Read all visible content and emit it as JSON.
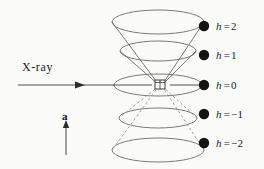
{
  "figure": {
    "background_color": "#fbfbfa",
    "line_color": "#5a5a5a",
    "beam_color": "#3c3c3c",
    "dot_color": "#141414"
  },
  "beam": {
    "label": "X-ray",
    "arrow_name": "incident-beam-arrow"
  },
  "axis": {
    "label": "a",
    "arrow_name": "rotation-axis-arrow"
  },
  "crystal": {
    "name": "crystal-sample",
    "shape": "cube"
  },
  "cones": [
    {
      "symbol": "h",
      "relation": "=",
      "value": "2",
      "label": "h = 2",
      "layer": 2,
      "dot_x": 204,
      "dot_y": 26,
      "label_x": 216,
      "label_y": 20,
      "ellipse_cy": 22,
      "ellipse_rx": 46,
      "ellipse_ry": 12,
      "hidden": false
    },
    {
      "symbol": "h",
      "relation": "=",
      "value": "1",
      "label": "h = 1",
      "layer": 1,
      "dot_x": 204,
      "dot_y": 55,
      "label_x": 216,
      "label_y": 49,
      "ellipse_cy": 51,
      "ellipse_rx": 38,
      "ellipse_ry": 10,
      "hidden": false
    },
    {
      "symbol": "h",
      "relation": "=",
      "value": "0",
      "label": "h = 0",
      "layer": 0,
      "dot_x": 204,
      "dot_y": 85,
      "label_x": 216,
      "label_y": 79,
      "ellipse_cy": 85,
      "ellipse_rx": 44,
      "ellipse_ry": 11,
      "hidden": false
    },
    {
      "symbol": "h",
      "relation": "=",
      "value": "−1",
      "label": "h = −1",
      "layer": -1,
      "dot_x": 204,
      "dot_y": 114,
      "label_x": 216,
      "label_y": 108,
      "ellipse_cy": 118,
      "ellipse_rx": 39,
      "ellipse_ry": 10,
      "hidden": true
    },
    {
      "symbol": "h",
      "relation": "=",
      "value": "−2",
      "label": "h = −2",
      "layer": -2,
      "dot_x": 204,
      "dot_y": 143,
      "label_x": 216,
      "label_y": 137,
      "ellipse_cy": 150,
      "ellipse_rx": 46,
      "ellipse_ry": 12,
      "hidden": true
    }
  ]
}
